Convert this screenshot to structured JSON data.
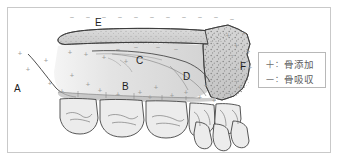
{
  "figure": {
    "background_color": "#ffffff",
    "frame_color": "#c9c9c9"
  },
  "labels": [
    {
      "id": "A",
      "text": "A",
      "x": 14,
      "y": 84
    },
    {
      "id": "B",
      "text": "B",
      "x": 122,
      "y": 82
    },
    {
      "id": "C",
      "text": "C",
      "x": 136,
      "y": 56
    },
    {
      "id": "D",
      "text": "D",
      "x": 183,
      "y": 72
    },
    {
      "id": "E",
      "text": "E",
      "x": 95,
      "y": 18
    },
    {
      "id": "F",
      "text": "F",
      "x": 240,
      "y": 62
    }
  ],
  "legend": {
    "title": "",
    "rows": [
      {
        "symbol": "＋",
        "separator": "：",
        "text": "骨添加"
      },
      {
        "symbol": "－",
        "separator": "：",
        "text": "骨吸収"
      }
    ]
  },
  "markers": {
    "plus_symbol": "+",
    "minus_symbol": "−",
    "plus_color": "#9a9a9a",
    "minus_color": "#9a9a9a",
    "plus_positions": [
      [
        20,
        56
      ],
      [
        28,
        72
      ],
      [
        46,
        63
      ],
      [
        50,
        86
      ],
      [
        62,
        94
      ],
      [
        70,
        55
      ],
      [
        72,
        78
      ],
      [
        86,
        57
      ],
      [
        88,
        87
      ],
      [
        100,
        93
      ],
      [
        104,
        60
      ],
      [
        118,
        97
      ],
      [
        126,
        64
      ],
      [
        140,
        95
      ],
      [
        150,
        100
      ],
      [
        156,
        90
      ],
      [
        172,
        98
      ],
      [
        186,
        95
      ],
      [
        200,
        100
      ],
      [
        206,
        88
      ],
      [
        214,
        103
      ],
      [
        228,
        38
      ],
      [
        236,
        48
      ],
      [
        244,
        36
      ],
      [
        248,
        54
      ],
      [
        250,
        70
      ],
      [
        240,
        90
      ]
    ],
    "minus_positions": [
      [
        72,
        20
      ],
      [
        88,
        20
      ],
      [
        104,
        20
      ],
      [
        120,
        20
      ],
      [
        136,
        20
      ],
      [
        152,
        20
      ],
      [
        168,
        20
      ],
      [
        184,
        20
      ],
      [
        200,
        20
      ],
      [
        216,
        20
      ],
      [
        232,
        22
      ],
      [
        118,
        52
      ],
      [
        136,
        50
      ],
      [
        158,
        50
      ],
      [
        176,
        52
      ],
      [
        232,
        58
      ],
      [
        234,
        72
      ],
      [
        236,
        84
      ],
      [
        228,
        96
      ]
    ]
  },
  "anatomy": {
    "bone_fill": "#d8d8d8",
    "bone_fill_light": "#e4e4e4",
    "bone_stroke": "#3a3a3a",
    "tooth_fill": "#ececec",
    "tooth_stroke": "#3a3a3a",
    "trabecular_color": "#8a8a8a",
    "regions": [
      {
        "key": "A",
        "name": "anterior-nasal-spine"
      },
      {
        "key": "B",
        "name": "alveolar-process"
      },
      {
        "key": "C",
        "name": "nasal-floor"
      },
      {
        "key": "D",
        "name": "maxillary-sinus-floor"
      },
      {
        "key": "E",
        "name": "hard-palate-nasal-surface"
      },
      {
        "key": "F",
        "name": "maxillary-tuberosity"
      }
    ]
  }
}
